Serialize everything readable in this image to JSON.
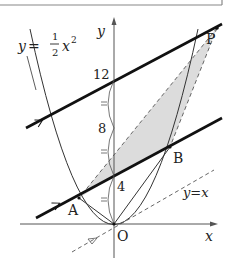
{
  "diagram": {
    "equation_label": {
      "lhs": "y",
      "eq": "=",
      "num": "1",
      "den": "2",
      "var": "x",
      "exp": "2"
    },
    "line_label": "y=x",
    "axes": {
      "x_label": "x",
      "y_label": "y",
      "origin_label": "O"
    },
    "y_ticks": [
      "4",
      "8",
      "12"
    ],
    "points": {
      "A": "A",
      "B": "B",
      "P": "P"
    },
    "colors": {
      "stroke": "#1a1a1a",
      "shade": "#dcdcdc",
      "dash": "#555555",
      "border": "#888888"
    }
  }
}
